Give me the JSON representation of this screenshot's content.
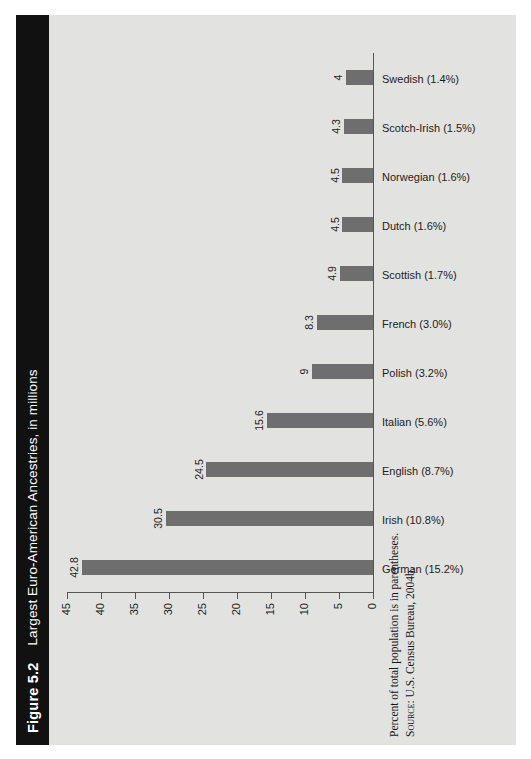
{
  "figure": {
    "number_label": "Figure 5.2",
    "title": "Largest Euro-American Ancestries, in millions",
    "footnote": "Percent of total population is in parentheses.",
    "source_label": "Source:",
    "source_text": "U.S. Census Bureau, 2004b."
  },
  "colors": {
    "title_bar_bg": "#111111",
    "title_bar_text": "#ffffff",
    "figure_bg": "#e2e2e0",
    "bar_fill": "#6e6e6e",
    "axis": "#555555",
    "text": "#1d1d1d"
  },
  "chart_data": {
    "type": "bar",
    "title": "Largest Euro-American Ancestries, in millions",
    "xlabel": "",
    "ylabel": "",
    "ylim": [
      0,
      45
    ],
    "yticks": [
      0,
      5,
      10,
      15,
      20,
      25,
      30,
      35,
      40,
      45
    ],
    "grid": false,
    "legend": null,
    "orientation": "vertical",
    "categories": [
      "German (15.2%)",
      "Irish (10.8%)",
      "English (8.7%)",
      "Italian (5.6%)",
      "Polish (3.2%)",
      "French (3.0%)",
      "Scottish (1.7%)",
      "Dutch (1.6%)",
      "Norwegian (1.6%)",
      "Scotch-Irish (1.5%)",
      "Swedish (1.4%)"
    ],
    "values": [
      42.8,
      30.5,
      24.5,
      15.6,
      9,
      8.3,
      4.9,
      4.5,
      4.5,
      4.3,
      4
    ],
    "value_labels": [
      "42.8",
      "30.5",
      "24.5",
      "15.6",
      "9",
      "8.3",
      "4.9",
      "4.5",
      "4.5",
      "4.3",
      "4"
    ],
    "percent_of_population": [
      15.2,
      10.8,
      8.7,
      5.6,
      3.2,
      3.0,
      1.7,
      1.6,
      1.6,
      1.5,
      1.4
    ],
    "ancestry_names": [
      "German",
      "Irish",
      "English",
      "Italian",
      "Polish",
      "French",
      "Scottish",
      "Dutch",
      "Norwegian",
      "Scotch-Irish",
      "Swedish"
    ],
    "units": "millions",
    "annotations": [
      "Percent of total population is in parentheses.",
      "Source: U.S. Census Bureau, 2004b."
    ]
  }
}
